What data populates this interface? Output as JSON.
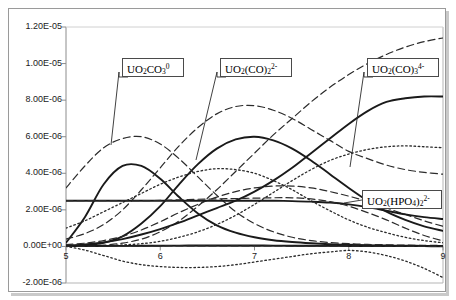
{
  "chart_data": {
    "type": "line",
    "title": "",
    "subtitle": "",
    "xlabel": "",
    "ylabel": "",
    "xlim": [
      5,
      9
    ],
    "ylim": [
      -2e-06,
      1.2e-05
    ],
    "grid": false,
    "legend_position": "annotations-inline",
    "x_ticks": [
      "5",
      "6",
      "7",
      "8",
      "9"
    ],
    "x_tick_values": [
      5,
      6,
      7,
      8,
      9
    ],
    "y_ticks": [
      "1.20E-05",
      "1.00E-05",
      "8.00E-06",
      "6.00E-06",
      "4.00E-06",
      "2.00E-06",
      "0.00E+00",
      "-2.00E-06"
    ],
    "y_tick_values": [
      1.2e-05,
      1e-05,
      8e-06,
      6e-06,
      4e-06,
      2e-06,
      0.0,
      -2e-06
    ],
    "x": [
      5.0,
      5.2,
      5.4,
      5.6,
      5.8,
      6.0,
      6.2,
      6.4,
      6.6,
      6.8,
      7.0,
      7.2,
      7.4,
      7.6,
      7.8,
      8.0,
      8.2,
      8.4,
      8.6,
      8.8,
      9.0
    ],
    "series": [
      {
        "name": "UO2CO3-0",
        "label": "UO2CO3(0)",
        "style": "solid",
        "values": [
          2e-07,
          1.6e-06,
          3.4e-06,
          4.4e-06,
          4.4e-06,
          3.7e-06,
          2.7e-06,
          1.8e-06,
          1.15e-06,
          7.5e-07,
          5e-07,
          3.4e-07,
          2.4e-07,
          1.7e-07,
          1.2e-07,
          9e-08,
          7e-08,
          5e-08,
          4e-08,
          3e-08,
          2.5e-08
        ]
      },
      {
        "name": "UO2-CO3-2-2minus",
        "label": "UO2(CO)2(2-)",
        "style": "solid",
        "values": [
          2e-08,
          6e-08,
          2e-07,
          5.5e-07,
          1.25e-06,
          2.2e-06,
          3.4e-06,
          4.5e-06,
          5.35e-06,
          5.85e-06,
          6e-06,
          5.8e-06,
          5.35e-06,
          4.7e-06,
          3.95e-06,
          3.2e-06,
          2.5e-06,
          1.9e-06,
          1.45e-06,
          1.1e-06,
          8.5e-07
        ]
      },
      {
        "name": "UO2-CO3-3-4minus",
        "label": "UO2(CO)3(4-)",
        "style": "dashed",
        "values": [
          1e-08,
          2.5e-08,
          7e-08,
          1.8e-07,
          4e-07,
          8e-07,
          1.4e-06,
          2.2e-06,
          3.1e-06,
          4.1e-06,
          5.1e-06,
          6.1e-06,
          7e-06,
          7.9e-06,
          8.7e-06,
          9.4e-06,
          1e-05,
          1.05e-05,
          1.09e-05,
          1.12e-05,
          1.14e-05
        ]
      },
      {
        "name": "UO2-HPO4-2-2minus",
        "label": "UO2(HPO4)2(2-)",
        "style": "solid",
        "values": [
          5e-08,
          1.1e-07,
          2.2e-07,
          4e-07,
          6.5e-07,
          9.5e-07,
          1.3e-06,
          1.7e-06,
          2.1e-06,
          2.5e-06,
          3e-06,
          3.6e-06,
          4.3e-06,
          5.1e-06,
          5.9e-06,
          6.7e-06,
          7.4e-06,
          7.9e-06,
          8.1e-06,
          8.2e-06,
          8.2e-06
        ]
      },
      {
        "name": "dashed-hump-early",
        "label": "",
        "style": "dashed",
        "values": [
          3.2e-06,
          4.4e-06,
          5.4e-06,
          5.9e-06,
          6e-06,
          5.6e-06,
          4.8e-06,
          3.8e-06,
          2.8e-06,
          1.9e-06,
          1.25e-06,
          8e-07,
          5e-07,
          3.2e-07,
          2.1e-07,
          1.5e-07,
          1.1e-07,
          9e-08,
          7e-08,
          6e-08,
          5e-08
        ]
      },
      {
        "name": "dashed-hump-mid",
        "label": "",
        "style": "dashed",
        "values": [
          4e-07,
          7e-07,
          1.2e-06,
          2e-06,
          3.1e-06,
          4.3e-06,
          5.5e-06,
          6.5e-06,
          7.25e-06,
          7.65e-06,
          7.7e-06,
          7.45e-06,
          7e-06,
          6.4e-06,
          5.8e-06,
          5.2e-06,
          4.8e-06,
          4.45e-06,
          4.2e-06,
          4.05e-06,
          3.95e-06
        ]
      },
      {
        "name": "dotted-hump-mid",
        "label": "",
        "style": "dotted",
        "values": [
          1e-06,
          1.4e-06,
          1.9e-06,
          2.4e-06,
          2.9e-06,
          3.4e-06,
          3.8e-06,
          4.1e-06,
          4.25e-06,
          4.2e-06,
          4e-06,
          3.6e-06,
          3.1e-06,
          2.5e-06,
          1.95e-06,
          1.45e-06,
          1.05e-06,
          7.5e-07,
          5e-07,
          3.2e-07,
          2e-07
        ]
      },
      {
        "name": "dotted-rise-late",
        "label": "",
        "style": "dotted",
        "values": [
          1e-08,
          2e-08,
          4e-08,
          8e-08,
          1.5e-07,
          2.8e-07,
          5e-07,
          8e-07,
          1.2e-06,
          1.7e-06,
          2.3e-06,
          2.95e-06,
          3.6e-06,
          4.2e-06,
          4.7e-06,
          5.05e-06,
          5.3e-06,
          5.45e-06,
          5.5e-06,
          5.45e-06,
          5.4e-06
        ]
      },
      {
        "name": "dashed-slow-rise",
        "label": "",
        "style": "dashed",
        "values": [
          1e-07,
          1.8e-07,
          3.2e-07,
          5.5e-07,
          9e-07,
          1.35e-06,
          1.85e-06,
          2.3e-06,
          2.7e-06,
          3e-06,
          3.2e-06,
          3.3e-06,
          3.3e-06,
          3.2e-06,
          3e-06,
          2.75e-06,
          2.45e-06,
          2.1e-06,
          1.75e-06,
          1.4e-06,
          1.1e-06
        ]
      },
      {
        "name": "solid-flat-baseline",
        "label": "",
        "style": "solid",
        "values": [
          2.5e-06,
          2.5e-06,
          2.5e-06,
          2.5e-06,
          2.5e-06,
          2.5e-06,
          2.5e-06,
          2.5e-06,
          2.5e-06,
          2.5e-06,
          2.5e-06,
          2.5e-06,
          2.48e-06,
          2.45e-06,
          2.4e-06,
          2.3e-06,
          2.15e-06,
          1.95e-06,
          1.75e-06,
          1.6e-06,
          1.5e-06
        ]
      },
      {
        "name": "dashed-flat-baseline",
        "label": "",
        "style": "dashed",
        "values": [
          2.5e-06,
          2.5e-06,
          2.5e-06,
          2.5e-06,
          2.5e-06,
          2.52e-06,
          2.55e-06,
          2.58e-06,
          2.6e-06,
          2.62e-06,
          2.64e-06,
          2.66e-06,
          2.66e-06,
          2.6e-06,
          2.45e-06,
          2.2e-06,
          1.85e-06,
          1.45e-06,
          1e-06,
          6e-07,
          3e-07
        ]
      },
      {
        "name": "dotted-negative-dip",
        "label": "",
        "style": "dotted",
        "values": [
          0.0,
          -2e-07,
          -5e-07,
          -8e-07,
          -1e-06,
          -1.1e-06,
          -1.15e-06,
          -1.15e-06,
          -1.1e-06,
          -1e-06,
          -8.5e-07,
          -7e-07,
          -5.5e-07,
          -4e-07,
          -3e-07,
          -2.2e-07,
          -3e-07,
          -5e-07,
          -8e-07,
          -1.2e-06,
          -1.7e-06
        ]
      },
      {
        "name": "solid-zero-baseline",
        "label": "",
        "style": "solid",
        "values": [
          2e-08,
          2e-08,
          2.5e-08,
          3e-08,
          3.5e-08,
          4e-08,
          4.5e-08,
          5e-08,
          5e-08,
          5e-08,
          5e-08,
          4.5e-08,
          4e-08,
          3.5e-08,
          3e-08,
          2.5e-08,
          2e-08,
          2e-08,
          1.5e-08,
          1.5e-08,
          1e-08
        ]
      },
      {
        "name": "dashed-zero-baseline",
        "label": "",
        "style": "dashed",
        "values": [
          1e-08,
          1e-08,
          1e-08,
          1.5e-08,
          2e-08,
          2.5e-08,
          3e-08,
          3e-08,
          3e-08,
          3e-08,
          2.5e-08,
          2.5e-08,
          2e-08,
          2e-08,
          1.5e-08,
          1.5e-08,
          1e-08,
          1e-08,
          1e-08,
          5e-09,
          5e-09
        ]
      }
    ],
    "annotations": [
      {
        "id": "anno-uo2co3",
        "html": "UO<sub>2</sub>CO<sub>3</sub><sup>0</sup>",
        "text": "UO2CO3 0",
        "box": {
          "left": 122,
          "top": 58,
          "width": 62,
          "height": 19
        },
        "leader": [
          [
            128,
            77
          ],
          [
            119,
            77
          ],
          [
            119,
            72
          ],
          [
            111,
            145
          ]
        ]
      },
      {
        "id": "anno-uo2co2",
        "html": "UO<sub>2</sub>(CO)<sub>2</sub><sup>2-</sup>",
        "text": "UO2(CO)2 2-",
        "box": {
          "left": 220,
          "top": 58,
          "width": 72,
          "height": 19
        },
        "leader": [
          [
            226,
            77
          ],
          [
            217,
            77
          ],
          [
            217,
            72
          ],
          [
            196,
            160
          ]
        ]
      },
      {
        "id": "anno-uo2co3-4",
        "html": "UO<sub>2</sub>(CO)<sub>3</sub><sup>4-</sup>",
        "text": "UO2(CO)3 4-",
        "box": {
          "left": 367,
          "top": 58,
          "width": 72,
          "height": 19
        },
        "leader": [
          [
            373,
            77
          ],
          [
            364,
            77
          ],
          [
            364,
            72
          ],
          [
            350,
            167
          ]
        ]
      },
      {
        "id": "anno-uo2hpo4",
        "html": "UO<sub>2</sub>(HPO<sub>4</sub>)<sub>2</sub><sup>2-</sup>",
        "text": "UO2(HPO4)2 2-",
        "box": {
          "left": 362,
          "top": 190,
          "width": 80,
          "height": 19
        },
        "leader": [
          [
            362,
            200
          ],
          [
            344,
            203
          ]
        ]
      }
    ]
  },
  "axes": {
    "y_axis_name": "concentration-axis",
    "x_axis_name": "ph-axis"
  }
}
